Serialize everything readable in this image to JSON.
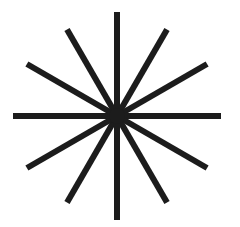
{
  "figure": {
    "name": "starburst",
    "icon": "starburst-icon",
    "center": [
      117,
      116
    ],
    "rays": 12,
    "ray_angle_step_deg": 30,
    "stroke_color": "#1c1c1c",
    "stroke_width": 6,
    "background": "#ffffff",
    "ray_lengths": [
      104,
      100,
      104,
      104,
      104,
      100,
      104,
      100,
      104,
      104,
      104,
      100
    ]
  }
}
